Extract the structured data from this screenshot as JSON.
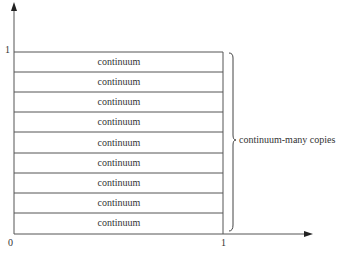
{
  "diagram": {
    "y_axis": {
      "tick_label": "1"
    },
    "x_axis": {
      "origin_label": "0",
      "tick_label": "1"
    },
    "rows": [
      {
        "label": "continuum"
      },
      {
        "label": "continuum"
      },
      {
        "label": "continuum"
      },
      {
        "label": "continuum"
      },
      {
        "label": "continuum"
      },
      {
        "label": "continuum"
      },
      {
        "label": "continuum"
      },
      {
        "label": "continuum"
      },
      {
        "label": "continuum"
      }
    ],
    "brace_label": "continuum-many copies"
  }
}
